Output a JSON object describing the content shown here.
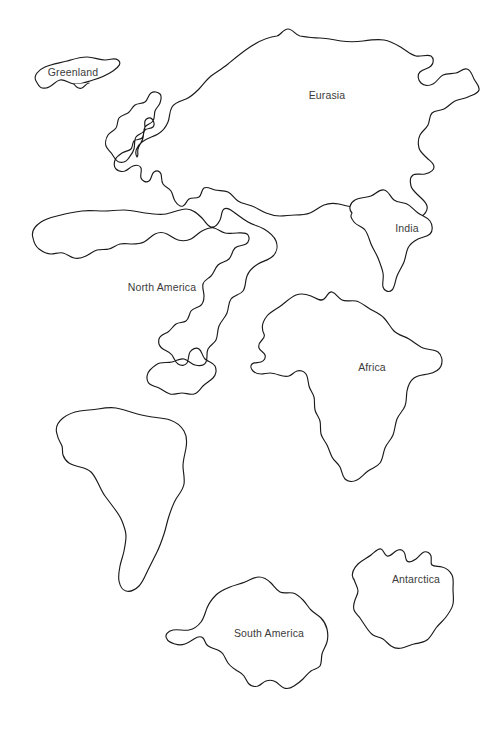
{
  "page": {
    "background_color": "#ffffff",
    "outline_color": "#1a1a1a",
    "label_color": "#3b3b3b",
    "width": 495,
    "height": 733
  },
  "map": {
    "type": "outline-map",
    "projection_note": "blank continents outline worksheet",
    "landmasses": [
      {
        "name": "greenland",
        "label": "Greenland",
        "label_x": 73,
        "label_y": 73,
        "path": "M35 76 C34 70 40 65 48 63 C56 61 62 58 70 57 C78 56 84 58 90 58 C96 58 100 55 104 57 C108 59 105 63 108 65 C111 67 115 66 116 70 C117 74 112 76 112 80 C112 84 108 85 104 86 C100 87 97 90 93 89 C89 88 88 84 84 83 C80 82 78 86 74 87 C70 88 68 84 64 84 C60 84 58 88 54 89 C50 90 46 89 43 87 C40 85 36 82 35 76 Z"
      },
      {
        "name": "eurasia",
        "label": "Eurasia",
        "label_x": 327,
        "label_y": 96,
        "path": "M138 156 C134 150 136 144 140 139 C144 134 150 132 155 129 C160 126 164 123 167 118 C170 113 170 107 174 103 C178 99 184 98 190 95 C196 92 201 88 207 83 C213 78 219 72 227 66 C235 60 244 54 253 50 C262 46 271 43 280 41 C286 40 288 34 293 33 C298 32 300 37 305 38 C312 39 320 40 328 41 C336 42 344 44 352 45 C360 46 368 44 376 43 C384 42 392 41 400 42 C408 43 414 47 420 51 C426 55 430 60 436 62 C442 64 448 62 453 64 C458 66 460 71 458 75 C456 79 450 81 446 80 C442 79 438 75 433 74 C428 73 424 76 419 76 C414 76 409 73 405 75 C401 77 400 82 396 84 C392 86 387 85 384 88 C381 91 382 96 379 99 C376 102 371 101 368 104 C365 107 366 112 365 117 C364 122 361 126 360 131 C359 136 362 141 365 144 C368 147 374 147 376 151 C378 155 373 158 370 161 C367 164 363 166 362 170 C361 174 364 178 368 181 C372 184 378 185 382 189 C386 193 388 199 386 204 C384 209 378 211 373 211 C368 211 364 208 360 205 C356 202 352 198 347 197 C342 196 337 199 332 200 C327 201 322 200 317 199 C312 198 307 196 302 196 C297 196 292 198 287 199 C282 200 277 200 272 199 C267 198 262 196 257 195 C252 194 247 195 243 193 C239 191 237 187 233 185 C229 183 224 184 220 183 C216 182 212 179 209 181 C206 183 207 188 204 190 C201 192 197 190 194 192 C191 194 191 198 188 199 C185 200 182 197 180 194 C178 191 178 187 176 184 C174 181 170 180 168 177 C166 174 167 170 166 167 C165 164 162 163 160 164 C158 165 158 169 156 171 C154 173 151 173 149 171 C147 169 148 165 147 162 C146 159 143 159 140 160 C137 161 134 164 131 165 C128 166 125 165 123 163 C121 161 121 157 122 154 C123 151 126 149 129 148 C132 147 136 148 138 146 C140 144 139 140 141 138 C143 136 147 137 149 135 C151 133 150 129 152 127 C154 125 157 126 159 124 C161 122 160 119 158 117 C156 115 152 115 150 117 C148 119 148 123 146 126 C144 129 140 130 138 133 C136 136 137 140 136 144 C135 148 132 151 130 154 C128 157 124 158 121 157 C118 156 116 152 114 149 C112 146 109 144 108 141 C107 138 108 134 110 131 C112 128 116 127 118 124 C120 121 119 117 121 114 C123 111 127 111 130 109 C133 107 134 103 137 101 C140 99 144 100 147 98 C150 96 150 92 153 90 C156 88 160 89 162 91 C164 93 163 97 162 100 C161 103 158 105 157 108 C156 111 157 115 155 118 C153 121 149 121 147 124 C145 127 146 131 145 135 C144 139 141 142 140 146 C139 150 140 154 138 156 Z"
      },
      {
        "name": "india",
        "label": "India",
        "label_x": 407,
        "label_y": 229,
        "path": "M359 212 C356 208 358 203 362 201 C366 199 371 201 375 200 C379 199 382 195 386 196 C390 197 390 202 393 204 C396 206 400 204 404 205 C408 206 411 209 415 211 C419 213 424 213 428 216 C432 219 434 224 433 229 C432 234 427 236 423 238 C419 240 414 241 411 244 C408 247 408 252 406 256 C404 260 401 263 399 267 C397 271 397 276 394 279 C391 282 386 281 384 277 C382 273 384 268 384 263 C384 258 382 253 380 249 C378 245 375 242 373 238 C371 234 370 229 367 226 C364 223 360 223 357 220 C354 217 356 214 359 212 Z"
      },
      {
        "name": "north-america",
        "label": "North America",
        "label_x": 162,
        "label_y": 288,
        "path": "M34 239 C32 233 36 227 42 223 C48 219 55 218 62 216 C69 214 76 212 83 211 C90 210 97 211 104 211 C111 211 118 210 125 210 C132 210 139 212 146 213 C153 214 160 215 167 213 C174 211 180 207 186 207 C192 207 196 211 201 213 C206 215 212 215 217 213 C222 211 225 206 230 206 C235 206 238 211 243 214 C248 217 254 218 259 221 C264 224 268 228 270 233 C272 238 271 244 267 248 C263 252 257 253 252 256 C247 259 243 263 241 268 C239 273 240 279 237 283 C234 287 229 287 226 291 C223 295 224 300 222 305 C220 310 216 313 214 318 C212 323 213 328 211 332 C209 336 205 337 203 341 C201 345 203 350 201 354 C199 358 194 358 190 357 C186 356 183 352 179 351 C175 350 171 353 167 354 C163 355 159 354 155 355 C151 356 148 359 145 362 C142 365 141 370 143 374 C145 378 150 378 154 380 C158 382 161 385 165 386 C169 387 173 385 177 385 C181 385 185 387 189 386 C193 385 195 381 198 378 C201 375 205 373 208 370 C211 367 212 362 210 358 C208 354 203 354 200 351 C197 348 197 343 194 341 C191 339 187 341 185 344 C183 347 184 352 182 355 C180 358 176 358 173 356 C170 354 169 350 167 347 C165 344 161 343 158 341 C155 339 153 335 154 331 C155 327 160 326 163 324 C166 322 168 318 171 316 C174 314 178 315 181 313 C184 311 184 306 186 303 C188 300 192 300 195 298 C198 296 199 292 199 288 C199 284 197 280 198 276 C199 272 203 271 206 268 C209 265 210 260 213 257 C216 254 221 254 224 251 C227 248 227 243 230 240 C233 237 238 238 241 236 C244 234 245 230 243 227 C241 224 236 225 232 225 C228 225 224 226 220 225 C216 224 213 221 209 220 C205 219 201 221 197 223 C193 225 190 229 186 231 C182 233 177 233 173 232 C169 231 166 228 162 226 C158 224 154 224 150 226 C146 228 143 232 139 234 C135 236 131 236 127 236 C123 236 119 235 115 236 C111 237 108 240 104 241 C100 242 96 241 92 242 C88 243 85 246 81 248 C77 250 73 251 69 250 C65 249 62 246 58 245 C54 244 50 246 46 246 C42 246 38 244 34 239 Z"
      },
      {
        "name": "africa",
        "label": "Africa",
        "label_x": 372,
        "label_y": 368,
        "path": "M259 333 C256 327 259 321 263 317 C267 313 272 311 276 307 C280 303 283 299 288 296 C293 293 299 293 304 291 C309 289 313 285 318 299 C318 299 318 299 318 299 M259 333 C256 327 259 321 263 317 C267 313 272 311 276 307 C280 303 284 299 289 296 C294 293 300 292 305 291 C310 290 314 286 319 295 M259 333"
      },
      {
        "name": "africa-outline",
        "label": "",
        "label_x": 0,
        "label_y": 0,
        "path": "M259 334 C256 328 258 321 262 316 C266 311 272 309 277 305 C282 301 286 297 291 294 C296 291 302 290 307 292 C312 294 314 299 319 301 C324 303 330 301 336 301 C342 301 348 303 354 305 C360 307 366 309 371 313 C376 317 379 323 384 327 C389 331 395 333 400 337 C405 341 409 346 414 349 C419 352 425 352 430 354 C435 356 439 360 440 365 C441 370 438 375 434 378 C430 381 424 381 420 384 C416 387 414 392 412 397 C410 402 409 407 407 412 C405 417 402 421 400 426 C398 431 398 437 396 442 C394 447 390 450 388 455 C386 460 386 466 383 470 C380 474 375 475 371 478 C367 481 364 485 360 487 C356 489 351 489 347 487 C343 485 341 481 338 478 C335 475 331 473 328 470 C325 467 323 463 321 459 C319 455 317 451 316 447 C315 443 316 438 315 434 C314 430 311 427 310 423 C309 419 310 414 309 410 C308 406 305 403 304 399 C303 395 304 390 303 386 C302 382 299 379 297 375 C295 371 294 367 292 364 C290 361 286 360 283 361 C280 362 278 365 275 366 C272 367 268 366 265 365 C262 364 259 362 257 359 C255 356 254 352 255 349 C256 346 259 345 261 343 C263 341 262 337 259 334 Z"
      },
      {
        "name": "south-america",
        "label": "South America",
        "label_x": 126,
        "label_y": 456,
        "path": "M57 435 C55 429 58 423 63 419 C68 415 74 413 80 411 C86 409 92 408 98 407 C104 406 110 406 116 407 C122 408 128 410 134 412 C140 414 146 415 152 416 C158 417 164 417 170 419 C176 421 181 425 184 430 C187 435 187 441 186 447 C185 453 183 459 183 465 C183 471 185 477 184 483 C183 489 179 493 176 498 C173 503 171 509 169 515 C167 521 166 527 164 533 C162 539 160 545 157 551 C154 557 151 563 148 569 C145 575 143 581 139 586 C135 591 130 595 125 596 C120 597 116 594 114 590 C112 586 113 581 114 576 C115 571 117 566 118 561 C119 556 119 551 120 546 C121 541 123 536 124 531 C125 526 126 521 126 516 C126 511 124 506 122 502 C120 498 117 494 114 491 C111 488 107 486 104 483 C101 480 99 476 97 472 C95 468 93 464 90 461 C87 458 83 457 79 456 C75 455 71 454 68 452 C65 450 62 447 60 444 C58 441 58 438 57 435 Z"
      },
      {
        "name": "antarctica",
        "label": "Antarctica",
        "label_x": 269,
        "label_y": 634,
        "path": "M168 639 C165 635 169 631 174 630 C179 629 185 630 190 630 C195 630 200 629 204 627 C208 625 210 621 212 617 C214 613 214 608 216 604 C218 600 222 598 226 595 C230 592 234 589 239 587 C244 585 249 584 254 583 C259 582 264 582 269 581 C274 580 278 577 283 577 C288 577 292 580 295 583 C298 586 300 590 304 592 C308 594 313 593 317 594 C321 595 324 598 327 601 C330 604 332 608 335 611 C338 614 342 615 345 618 C348 621 349 625 350 629 C351 633 351 638 350 642 C349 646 346 649 345 653 C344 657 345 662 343 665 C341 668 337 668 334 670 C331 672 329 675 326 677 C323 679 319 680 316 682 C313 684 311 687 308 689 C305 691 301 691 298 690 C295 689 293 686 290 684 C287 682 283 681 280 682 C277 683 275 686 272 688 C269 690 265 691 262 690 C259 689 257 686 255 683 C253 680 251 677 248 675 C245 673 241 673 238 671 C235 669 233 666 231 663 C229 660 227 657 224 655 C221 653 217 653 214 652 C211 651 208 649 206 646 C204 643 205 640 203 638 C201 636 197 637 194 638 C191 639 188 641 185 642 C182 643 178 643 175 643 C172 643 169 642 168 639 Z"
      },
      {
        "name": "australia",
        "label": "Australia",
        "label_x": 416,
        "label_y": 580,
        "path": "M353 577 C351 572 354 567 358 563 C362 559 367 557 371 554 C375 551 378 548 381 549 C384 550 384 555 387 556 C390 557 393 553 396 551 C399 549 402 549 404 552 C406 555 405 559 407 561 C409 563 413 561 416 559 C419 557 421 553 424 552 C427 551 430 553 431 556 C432 559 430 563 432 565 C434 567 438 566 442 567 C446 568 450 571 452 575 C454 579 453 584 453 589 C453 594 454 599 453 604 C452 609 449 613 446 617 C443 621 439 624 436 628 C433 632 431 637 427 640 C423 643 418 643 414 644 C410 645 406 647 402 648 C398 649 394 648 391 646 C388 644 386 641 383 639 C380 637 376 637 373 635 C370 633 368 630 366 627 C364 624 362 621 360 618 C358 615 355 613 354 610 C353 607 354 603 355 600 C356 597 358 594 358 591 C358 588 356 585 355 582 C354 579 354 578 353 577 Z"
      }
    ]
  }
}
